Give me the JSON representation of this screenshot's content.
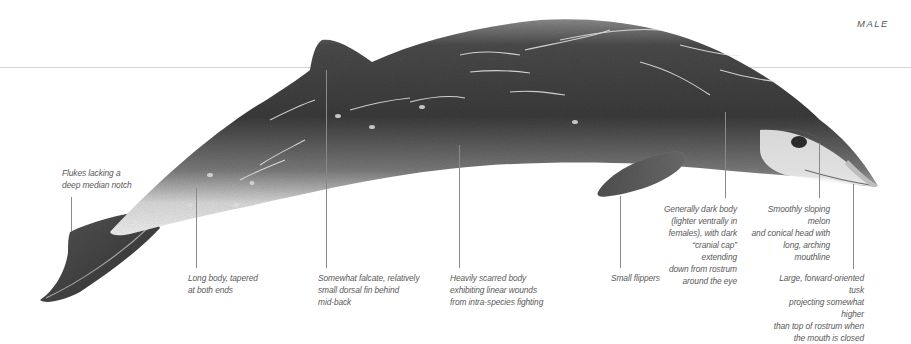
{
  "diagram": {
    "sex_tag": "MALE",
    "colors": {
      "body_dark": "#3c3c3c",
      "body_mid": "#6e6e6e",
      "belly": "#e6e6e6",
      "leader_line": "#8a8a8a",
      "waterline": "#d2d2d2",
      "label_text": "#5a5a5a"
    },
    "annotations": [
      {
        "id": "flukes",
        "text": "Flukes lacking a\ndeep median notch"
      },
      {
        "id": "long-body",
        "text": "Long body, tapered\nat both ends"
      },
      {
        "id": "dorsal-fin",
        "text": "Somewhat falcate, relatively\nsmall dorsal fin behind\nmid-back"
      },
      {
        "id": "scarred-body",
        "text": "Heavily scarred body\nexhibiting linear wounds\nfrom intra-species fighting"
      },
      {
        "id": "flippers",
        "text": "Small flippers"
      },
      {
        "id": "coloration",
        "text": "Generally dark body\n(lighter ventrally in\nfemales), with dark\n“cranial cap” extending\ndown from rostrum\naround the eye"
      },
      {
        "id": "melon",
        "text": "Smoothly sloping melon\nand conical head with\nlong, arching mouthline"
      },
      {
        "id": "tusk",
        "text": "Large, forward-oriented tusk\nprojecting somewhat higher\nthan top of rostrum when\nthe mouth is closed"
      }
    ]
  }
}
